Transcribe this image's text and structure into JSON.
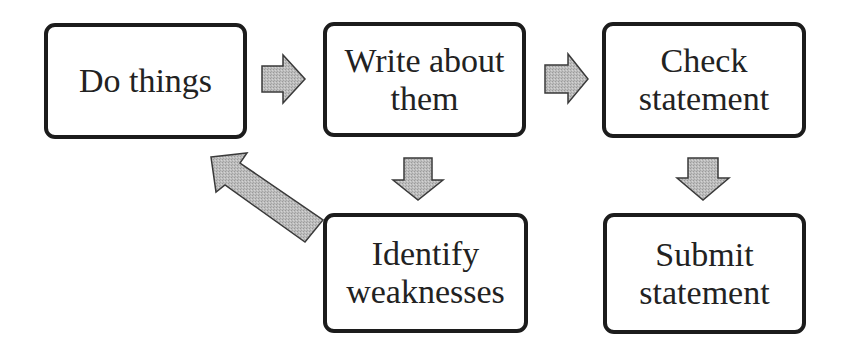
{
  "diagram": {
    "type": "flowchart",
    "colors": {
      "box_border": "#1c1c1c",
      "box_fill": "#ffffff",
      "text": "#222222",
      "arrow_fill": "#b8b8b8",
      "arrow_stroke": "#3a3a3a"
    },
    "nodes": [
      {
        "id": "do",
        "label": "Do things"
      },
      {
        "id": "write",
        "label": "Write about\nthem"
      },
      {
        "id": "check",
        "label": "Check\nstatement"
      },
      {
        "id": "identify",
        "label": "Identify\nweaknesses"
      },
      {
        "id": "submit",
        "label": "Submit\nstatement"
      }
    ],
    "edges": [
      {
        "from": "do",
        "to": "write",
        "direction": "right"
      },
      {
        "from": "write",
        "to": "check",
        "direction": "right"
      },
      {
        "from": "write",
        "to": "identify",
        "direction": "down"
      },
      {
        "from": "check",
        "to": "submit",
        "direction": "down"
      },
      {
        "from": "identify",
        "to": "do",
        "direction": "up-left"
      }
    ]
  }
}
